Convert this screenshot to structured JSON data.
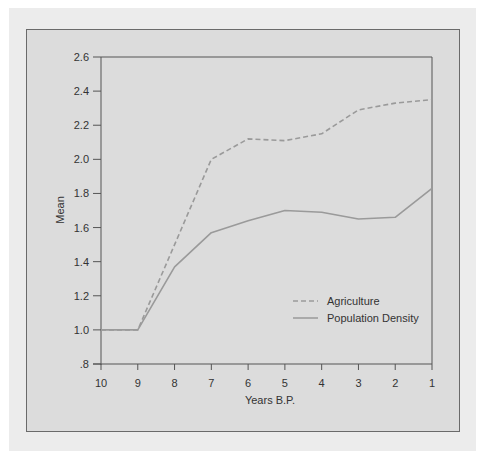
{
  "chart_data": {
    "type": "line",
    "title": "",
    "xlabel": "Years B.P.",
    "ylabel": "Mean",
    "x": [
      10,
      9,
      8,
      7,
      6,
      5,
      4,
      3,
      2,
      1
    ],
    "x_tick_labels": [
      "10",
      "9",
      "8",
      "7",
      "6",
      "5",
      "4",
      "3",
      "2",
      "1"
    ],
    "y_ticks": [
      0.8,
      1.0,
      1.2,
      1.4,
      1.6,
      1.8,
      2.0,
      2.2,
      2.4,
      2.6
    ],
    "y_tick_labels": [
      ".8",
      "1.0",
      "1.2",
      "1.4",
      "1.6",
      "1.8",
      "2.0",
      "2.2",
      "2.4",
      "2.6"
    ],
    "ylim": [
      0.8,
      2.6
    ],
    "xlim": [
      10,
      1
    ],
    "grid": false,
    "legend_position": "lower right (inside plot)",
    "series": [
      {
        "name": "Agriculture",
        "style": "dashed",
        "color": "#9a9a9a",
        "values": [
          1.0,
          1.0,
          1.5,
          2.0,
          2.12,
          2.11,
          2.15,
          2.29,
          2.33,
          2.35
        ]
      },
      {
        "name": "Population Density",
        "style": "solid",
        "color": "#9a9a9a",
        "values": [
          1.0,
          1.0,
          1.37,
          1.57,
          1.64,
          1.7,
          1.69,
          1.65,
          1.66,
          1.83
        ]
      }
    ]
  },
  "colors": {
    "page_background": "#ffffff",
    "outer_panel": "#ececec",
    "plot_background": "#dcdcdc",
    "axis": "#555555",
    "series_line": "#9a9a9a"
  }
}
